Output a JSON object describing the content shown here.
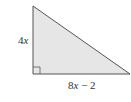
{
  "diagram": {
    "type": "right-triangle",
    "fill_color": "#e6e6e6",
    "stroke_color": "#555555",
    "vertices": {
      "top": [
        33,
        6
      ],
      "right_angle": [
        33,
        74
      ],
      "right": [
        130,
        74
      ]
    },
    "right_angle_marker": true,
    "labels": {
      "vertical_leg": {
        "coef": "4",
        "var": "x"
      },
      "horizontal_leg": {
        "coef": "8",
        "var": "x",
        "rest": " − 2"
      }
    }
  }
}
